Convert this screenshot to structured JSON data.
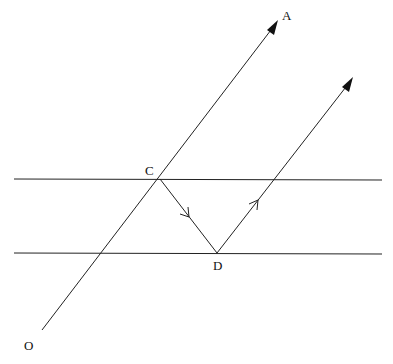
{
  "diagram": {
    "type": "geometry",
    "colors": {
      "stroke": "#222222",
      "background": "#ffffff",
      "text": "#111111"
    },
    "labels": {
      "A": "A",
      "C": "C",
      "D": "D",
      "O": "O"
    },
    "points": {
      "O": [
        42,
        330
      ],
      "A": [
        278,
        20
      ],
      "C": [
        160,
        179
      ],
      "D": [
        217,
        253
      ],
      "E": [
        353,
        77
      ]
    },
    "lines": [
      {
        "name": "ray-OA",
        "from": "O",
        "to": "A",
        "arrow": "filled-end"
      },
      {
        "name": "parallel-line-top",
        "from": [
          14,
          179
        ],
        "to": [
          382,
          180
        ]
      },
      {
        "name": "parallel-line-bottom",
        "from": [
          14,
          253
        ],
        "to": [
          382,
          254
        ]
      },
      {
        "name": "segment-CD",
        "from": "C",
        "to": "D",
        "arrow": "open-mid"
      },
      {
        "name": "ray-D-up",
        "from": "D",
        "to": "E",
        "arrow": "filled-end, open-mid"
      }
    ]
  }
}
